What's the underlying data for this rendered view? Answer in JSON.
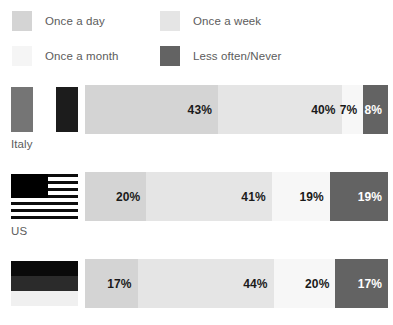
{
  "legend": {
    "items": [
      {
        "label": "Once a day",
        "color": "#d4d4d4",
        "key": "once-a-day"
      },
      {
        "label": "Once a week",
        "color": "#e5e5e5",
        "key": "once-a-week"
      },
      {
        "label": "Once a month",
        "color": "#f5f5f5",
        "key": "once-a-month"
      },
      {
        "label": "Less often/Never",
        "color": "#636363",
        "key": "less-often-never"
      }
    ]
  },
  "rows": [
    {
      "country": "Italy",
      "flag": "italy-flag",
      "segments": [
        {
          "label": "43%",
          "value": 43,
          "color": "#d4d4d4",
          "tone": "light"
        },
        {
          "label": "40%",
          "value": 40,
          "color": "#e5e5e5",
          "tone": "light"
        },
        {
          "label": "7%",
          "value": 7,
          "color": "#f7f7f7",
          "tone": "light"
        },
        {
          "label": "8%",
          "value": 8,
          "color": "#636363",
          "tone": "dark"
        }
      ]
    },
    {
      "country": "US",
      "flag": "us-flag",
      "segments": [
        {
          "label": "20%",
          "value": 20,
          "color": "#d4d4d4",
          "tone": "light"
        },
        {
          "label": "41%",
          "value": 41,
          "color": "#e5e5e5",
          "tone": "light"
        },
        {
          "label": "19%",
          "value": 19,
          "color": "#f7f7f7",
          "tone": "light"
        },
        {
          "label": "19%",
          "value": 19,
          "color": "#636363",
          "tone": "dark"
        }
      ]
    },
    {
      "country": "",
      "flag": "germany-flag",
      "segments": [
        {
          "label": "17%",
          "value": 17,
          "color": "#d4d4d4",
          "tone": "light"
        },
        {
          "label": "44%",
          "value": 44,
          "color": "#e5e5e5",
          "tone": "light"
        },
        {
          "label": "20%",
          "value": 20,
          "color": "#f7f7f7",
          "tone": "light"
        },
        {
          "label": "17%",
          "value": 17,
          "color": "#636363",
          "tone": "dark"
        }
      ]
    }
  ],
  "chart_data": {
    "type": "bar",
    "title": "",
    "xlabel": "",
    "ylabel": "",
    "orientation": "horizontal",
    "stacked": true,
    "units": "percent",
    "xlim": [
      0,
      100
    ],
    "grid": false,
    "legend_position": "top",
    "categories": [
      "Italy",
      "US",
      "Germany"
    ],
    "series": [
      {
        "name": "Once a day",
        "color": "#d4d4d4",
        "values": [
          43,
          20,
          17
        ]
      },
      {
        "name": "Once a week",
        "color": "#e5e5e5",
        "values": [
          40,
          41,
          44
        ]
      },
      {
        "name": "Once a month",
        "color": "#f5f5f5",
        "values": [
          7,
          19,
          20
        ]
      },
      {
        "name": "Less often/Never",
        "color": "#636363",
        "values": [
          8,
          19,
          17
        ]
      }
    ],
    "data_labels": [
      [
        "43%",
        "40%",
        "7%",
        "8%"
      ],
      [
        "20%",
        "41%",
        "19%",
        "19%"
      ],
      [
        "17%",
        "44%",
        "20%",
        "17%"
      ]
    ]
  }
}
